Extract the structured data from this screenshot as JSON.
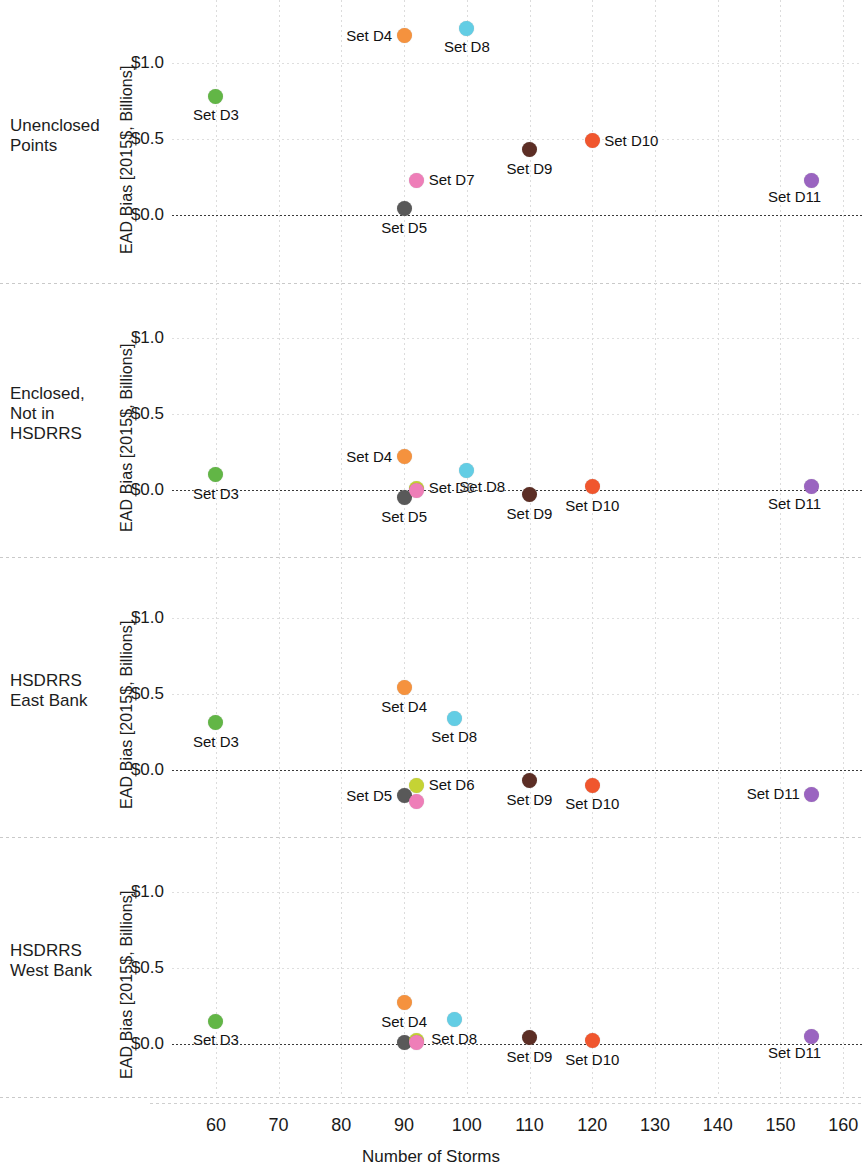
{
  "figure": {
    "width": 862,
    "height": 1166,
    "xlabel": "Number of Storms",
    "ylabel": "EAD Bias [2015$, Billions]"
  },
  "axis": {
    "x_ticks": [
      60,
      70,
      80,
      90,
      100,
      110,
      120,
      130,
      140,
      150,
      160
    ],
    "x_tick_labels": [
      "60",
      "70",
      "80",
      "90",
      "100",
      "110",
      "120",
      "130",
      "140",
      "150",
      "160"
    ],
    "xlim": [
      53,
      163
    ],
    "y_ticks": [
      0.0,
      0.5,
      1.0
    ],
    "y_tick_labels": [
      "$0.0",
      "$0.5",
      "$1.0"
    ],
    "ylim": [
      -0.28,
      1.42
    ],
    "grid": true,
    "zero_reference_line": 0.0
  },
  "series_colors": {
    "Set D3": "#62b646",
    "Set D4": "#f5923e",
    "Set D5": "#595959",
    "Set D6": "#c5d334",
    "Set D7": "#ee7eb8",
    "Set D8": "#63cde4",
    "Set D9": "#5c2e25",
    "Set D10": "#f0562e",
    "Set D11": "#9a64c0"
  },
  "panels": [
    {
      "row_label": "Unenclosed\nPoints",
      "row_label_lines": [
        "Unenclosed",
        "Points"
      ],
      "ylabel": "EAD Bias [2015$, Billions]"
    },
    {
      "row_label": "Enclosed,\nNot in\nHSDRRS",
      "row_label_lines": [
        "Enclosed,",
        "Not in",
        "HSDRRS"
      ],
      "ylabel": "EAD Bias [2015$, Billions]"
    },
    {
      "row_label": "HSDRRS\nEast Bank",
      "row_label_lines": [
        "HSDRRS",
        "East Bank"
      ],
      "ylabel": "EAD Bias [2015$, Billions]"
    },
    {
      "row_label": "HSDRRS\nWest Bank",
      "row_label_lines": [
        "HSDRRS",
        "West Bank"
      ],
      "ylabel": "EAD Bias [2015$, Billions]"
    }
  ],
  "chart_data": {
    "type": "scatter",
    "title": "",
    "xlabel": "Number of Storms",
    "ylabel": "EAD Bias [2015$, Billions]",
    "xlim": [
      53,
      163
    ],
    "x_ticks": [
      60,
      70,
      80,
      90,
      100,
      110,
      120,
      130,
      140,
      150,
      160
    ],
    "y_ticks": [
      0.0,
      0.5,
      1.0
    ],
    "grid": true,
    "legend": "none (points labeled in-place)",
    "panel_layout": "4 stacked subplots sharing the x-axis",
    "panels": [
      {
        "name": "Unenclosed Points",
        "ylim": [
          -0.28,
          1.42
        ],
        "points": [
          {
            "label": "Set D3",
            "x": 60,
            "y": 0.78,
            "color": "#62b646",
            "label_pos": "below"
          },
          {
            "label": "Set D4",
            "x": 90,
            "y": 1.18,
            "color": "#f5923e",
            "label_pos": "left"
          },
          {
            "label": "Set D5",
            "x": 90,
            "y": 0.04,
            "color": "#595959",
            "label_pos": "below"
          },
          {
            "label": "Set D7",
            "x": 92,
            "y": 0.23,
            "color": "#ee7eb8",
            "label_pos": "right"
          },
          {
            "label": "Set D8",
            "x": 100,
            "y": 1.23,
            "color": "#63cde4",
            "label_pos": "below"
          },
          {
            "label": "Set D9",
            "x": 110,
            "y": 0.43,
            "color": "#5c2e25",
            "label_pos": "below"
          },
          {
            "label": "Set D10",
            "x": 120,
            "y": 0.49,
            "color": "#f0562e",
            "label_pos": "right"
          },
          {
            "label": "Set D11",
            "x": 155,
            "y": 0.23,
            "color": "#9a64c0",
            "label_pos": "below-left"
          }
        ]
      },
      {
        "name": "Enclosed, Not in HSDRRS",
        "ylim": [
          -0.28,
          1.42
        ],
        "points": [
          {
            "label": "Set D3",
            "x": 60,
            "y": 0.1,
            "color": "#62b646",
            "label_pos": "below"
          },
          {
            "label": "Set D4",
            "x": 90,
            "y": 0.22,
            "color": "#f5923e",
            "label_pos": "left"
          },
          {
            "label": "Set D5",
            "x": 90,
            "y": -0.05,
            "color": "#595959",
            "label_pos": "below"
          },
          {
            "label": "Set D6",
            "x": 92,
            "y": 0.01,
            "color": "#c5d334",
            "label_pos": "right"
          },
          {
            "label": "Set D7",
            "x": 92,
            "y": 0.0,
            "color": "#ee7eb8",
            "label_pos": "hidden"
          },
          {
            "label": "Set D8",
            "x": 100,
            "y": 0.13,
            "color": "#63cde4",
            "label_pos": "below-right"
          },
          {
            "label": "Set D9",
            "x": 110,
            "y": -0.03,
            "color": "#5c2e25",
            "label_pos": "below"
          },
          {
            "label": "Set D10",
            "x": 120,
            "y": 0.02,
            "color": "#f0562e",
            "label_pos": "below"
          },
          {
            "label": "Set D11",
            "x": 155,
            "y": 0.02,
            "color": "#9a64c0",
            "label_pos": "below-left"
          }
        ]
      },
      {
        "name": "HSDRRS East Bank",
        "ylim": [
          -0.28,
          1.42
        ],
        "points": [
          {
            "label": "Set D3",
            "x": 60,
            "y": 0.31,
            "color": "#62b646",
            "label_pos": "below"
          },
          {
            "label": "Set D4",
            "x": 90,
            "y": 0.54,
            "color": "#f5923e",
            "label_pos": "below"
          },
          {
            "label": "Set D5",
            "x": 90,
            "y": -0.17,
            "color": "#595959",
            "label_pos": "left"
          },
          {
            "label": "Set D6",
            "x": 92,
            "y": -0.1,
            "color": "#c5d334",
            "label_pos": "right"
          },
          {
            "label": "Set D7",
            "x": 92,
            "y": -0.21,
            "color": "#ee7eb8",
            "label_pos": "hidden"
          },
          {
            "label": "Set D8",
            "x": 98,
            "y": 0.34,
            "color": "#63cde4",
            "label_pos": "below"
          },
          {
            "label": "Set D9",
            "x": 110,
            "y": -0.07,
            "color": "#5c2e25",
            "label_pos": "below"
          },
          {
            "label": "Set D10",
            "x": 120,
            "y": -0.1,
            "color": "#f0562e",
            "label_pos": "below"
          },
          {
            "label": "Set D11",
            "x": 155,
            "y": -0.16,
            "color": "#9a64c0",
            "label_pos": "left"
          }
        ]
      },
      {
        "name": "HSDRRS West Bank",
        "ylim": [
          -0.28,
          1.42
        ],
        "points": [
          {
            "label": "Set D3",
            "x": 60,
            "y": 0.15,
            "color": "#62b646",
            "label_pos": "below"
          },
          {
            "label": "Set D4",
            "x": 90,
            "y": 0.27,
            "color": "#f5923e",
            "label_pos": "below"
          },
          {
            "label": "Set D5",
            "x": 90,
            "y": 0.01,
            "color": "#595959",
            "label_pos": "hidden"
          },
          {
            "label": "Set D6",
            "x": 92,
            "y": 0.02,
            "color": "#c5d334",
            "label_pos": "hidden"
          },
          {
            "label": "Set D7",
            "x": 92,
            "y": 0.01,
            "color": "#ee7eb8",
            "label_pos": "hidden"
          },
          {
            "label": "Set D8",
            "x": 98,
            "y": 0.16,
            "color": "#63cde4",
            "label_pos": "below"
          },
          {
            "label": "Set D9",
            "x": 110,
            "y": 0.04,
            "color": "#5c2e25",
            "label_pos": "below"
          },
          {
            "label": "Set D10",
            "x": 120,
            "y": 0.02,
            "color": "#f0562e",
            "label_pos": "below"
          },
          {
            "label": "Set D11",
            "x": 155,
            "y": 0.05,
            "color": "#9a64c0",
            "label_pos": "below-left"
          }
        ]
      }
    ]
  }
}
